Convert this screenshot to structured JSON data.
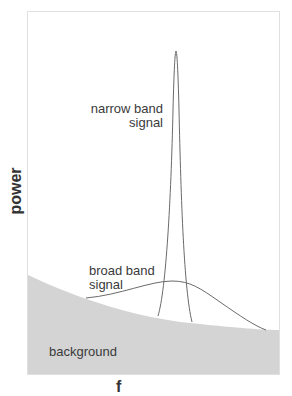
{
  "diagram": {
    "type": "spectral power diagram",
    "y_axis_label": "power",
    "x_axis_label": "f",
    "labels": {
      "narrow_band_line1": "narrow band",
      "narrow_band_line2": "signal",
      "broad_band_line1": "broad band",
      "broad_band_line2": "signal",
      "background": "background"
    },
    "colors": {
      "background_fill": "#d4d4d4",
      "curve_stroke": "#6a6a6a",
      "frame_stroke": "#e0e0e0",
      "text": "#3a3a3a"
    }
  }
}
